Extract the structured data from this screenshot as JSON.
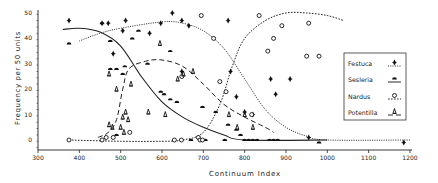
{
  "chart_data": {
    "type": "scatter",
    "title": "",
    "xlabel": "Continuum Index",
    "ylabel": "Frequency per 50 units",
    "xlim": [
      300,
      1200
    ],
    "ylim": [
      -3,
      50
    ],
    "xticks": [
      300,
      400,
      500,
      600,
      700,
      800,
      900,
      1000,
      1100,
      1200
    ],
    "yticks": [
      0,
      10,
      20,
      30,
      40,
      50
    ],
    "grid": false,
    "legend_position": "right-inside",
    "series": [
      {
        "name": "Festuca",
        "marker": "diamond-bar",
        "line": "dotted",
        "points": [
          [
            375,
            47
          ],
          [
            455,
            46
          ],
          [
            470,
            46
          ],
          [
            482,
            34
          ],
          [
            512,
            47
          ],
          [
            505,
            43
          ],
          [
            570,
            42
          ],
          [
            597,
            46
          ],
          [
            625,
            50
          ],
          [
            648,
            47
          ],
          [
            665,
            45
          ],
          [
            760,
            47
          ],
          [
            863,
            24
          ],
          [
            875,
            18
          ],
          [
            910,
            24
          ],
          [
            955,
            1
          ],
          [
            1185,
            -1
          ],
          [
            648,
            27
          ],
          [
            766,
            27
          ],
          [
            780,
            17
          ],
          [
            800,
            11
          ],
          [
            820,
            10
          ]
        ],
        "curve": [
          [
            400,
            39
          ],
          [
            450,
            42
          ],
          [
            500,
            44
          ],
          [
            600,
            46.5
          ],
          [
            650,
            46
          ],
          [
            700,
            43
          ],
          [
            750,
            36
          ],
          [
            800,
            24
          ],
          [
            850,
            12
          ],
          [
            900,
            5
          ],
          [
            950,
            1.5
          ],
          [
            1000,
            0
          ],
          [
            1200,
            0
          ]
        ]
      },
      {
        "name": "Sesleria",
        "marker": "half-disc",
        "line": "solid",
        "points": [
          [
            375,
            38
          ],
          [
            455,
            46
          ],
          [
            475,
            39
          ],
          [
            475,
            28
          ],
          [
            490,
            28
          ],
          [
            505,
            26
          ],
          [
            510,
            29
          ],
          [
            528,
            40
          ],
          [
            543,
            43
          ],
          [
            565,
            30
          ],
          [
            597,
            19
          ],
          [
            605,
            18
          ],
          [
            620,
            16
          ],
          [
            636,
            15
          ],
          [
            698,
            13
          ],
          [
            730,
            11
          ],
          [
            760,
            6
          ],
          [
            780,
            4
          ],
          [
            790,
            2
          ],
          [
            800,
            0
          ],
          [
            810,
            0
          ],
          [
            820,
            0
          ],
          [
            830,
            0
          ],
          [
            860,
            0
          ],
          [
            870,
            0
          ],
          [
            880,
            0
          ],
          [
            980,
            -1
          ],
          [
            490,
            2
          ],
          [
            670,
            0
          ],
          [
            700,
            0
          ],
          [
            705,
            0
          ],
          [
            752,
            0
          ],
          [
            620,
            35
          ]
        ],
        "curve": [
          [
            360,
            43.5
          ],
          [
            400,
            44
          ],
          [
            450,
            42.5
          ],
          [
            500,
            37
          ],
          [
            550,
            25
          ],
          [
            600,
            15
          ],
          [
            650,
            9
          ],
          [
            700,
            5
          ],
          [
            750,
            2
          ],
          [
            800,
            0
          ],
          [
            1000,
            0
          ]
        ]
      },
      {
        "name": "Nardus",
        "marker": "circle",
        "line": "short-dash",
        "points": [
          [
            375,
            0
          ],
          [
            455,
            0
          ],
          [
            465,
            1
          ],
          [
            482,
            1
          ],
          [
            522,
            3
          ],
          [
            630,
            0
          ],
          [
            647,
            0
          ],
          [
            688,
            1
          ],
          [
            692,
            0
          ],
          [
            698,
            0
          ],
          [
            740,
            23
          ],
          [
            755,
            19
          ],
          [
            695,
            49
          ],
          [
            725,
            40
          ],
          [
            817,
            10
          ],
          [
            835,
            49
          ],
          [
            870,
            40
          ],
          [
            856,
            35
          ],
          [
            890,
            45
          ],
          [
            955,
            46
          ],
          [
            950,
            33
          ],
          [
            980,
            33
          ],
          [
            648,
            25
          ]
        ],
        "curve": [
          [
            375,
            0
          ],
          [
            500,
            -0.5
          ],
          [
            600,
            -0.5
          ],
          [
            650,
            0
          ],
          [
            700,
            3
          ],
          [
            740,
            14
          ],
          [
            770,
            29
          ],
          [
            800,
            40
          ],
          [
            850,
            47
          ],
          [
            900,
            50
          ],
          [
            950,
            50
          ],
          [
            1000,
            49
          ],
          [
            1040,
            47
          ]
        ]
      },
      {
        "name": "Potentilla",
        "marker": "triangle-bar",
        "line": "long-dash",
        "points": [
          [
            472,
            26
          ],
          [
            490,
            20
          ],
          [
            472,
            6
          ],
          [
            500,
            5
          ],
          [
            505,
            9
          ],
          [
            512,
            11
          ],
          [
            518,
            8
          ],
          [
            508,
            3
          ],
          [
            525,
            22
          ],
          [
            567,
            11
          ],
          [
            595,
            38
          ],
          [
            608,
            10
          ],
          [
            638,
            24
          ],
          [
            652,
            26
          ],
          [
            675,
            27
          ],
          [
            762,
            10
          ],
          [
            782,
            5
          ],
          [
            800,
            10
          ],
          [
            820,
            5
          ],
          [
            480,
            5
          ]
        ],
        "curve": [
          [
            445,
            1
          ],
          [
            470,
            3
          ],
          [
            490,
            8
          ],
          [
            505,
            20
          ],
          [
            520,
            28
          ],
          [
            560,
            31
          ],
          [
            600,
            31.5
          ],
          [
            650,
            29
          ],
          [
            700,
            22
          ],
          [
            750,
            14
          ],
          [
            800,
            9
          ],
          [
            850,
            5
          ],
          [
            870,
            3
          ]
        ]
      }
    ]
  },
  "legend": {
    "items": [
      {
        "label": "Festuca"
      },
      {
        "label": "Sesleria"
      },
      {
        "label": "Nardus"
      },
      {
        "label": "Potentilla"
      }
    ]
  },
  "axes": {
    "xlabel": "Continuum Index",
    "ylabel": "Frequency per 50 units",
    "xtick_labels": [
      "300",
      "400",
      "500",
      "600",
      "700",
      "800",
      "900",
      "1000",
      "1100",
      "1200"
    ],
    "ytick_labels": [
      "0",
      "10",
      "20",
      "30",
      "40",
      "50"
    ]
  }
}
